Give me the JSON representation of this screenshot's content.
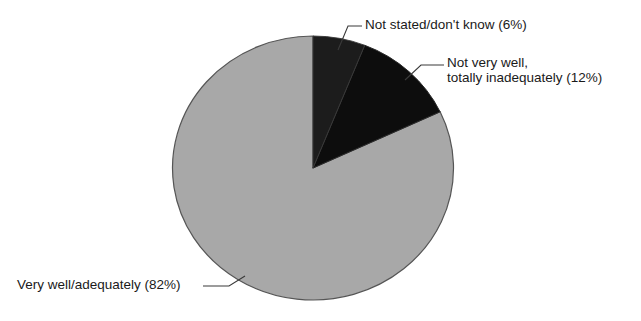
{
  "chart_data": {
    "type": "pie",
    "title": "",
    "subtitle": "",
    "xlabel": "",
    "ylabel": "",
    "grid": false,
    "legend_position": "callout-labels",
    "start_angle_deg": 0,
    "direction": "clockwise",
    "categories": [
      "Not stated/don't know",
      "Not very well, totally inadequately",
      "Very well/adequately"
    ],
    "values": [
      6,
      12,
      82
    ],
    "units": "%",
    "slices": [
      {
        "name": "Not stated/don't know",
        "value": 6,
        "label": "Not stated/don't know (6%)",
        "label_lines": [
          "Not stated/don't know (6%)"
        ],
        "color": "#1c1c1c",
        "start_deg": 0,
        "end_deg": 21.6
      },
      {
        "name": "Not very well, totally inadequately",
        "value": 12,
        "label": "Not very well, totally inadequately (12%)",
        "label_lines": [
          "Not very well,",
          "totally inadequately (12%)"
        ],
        "color": "#0d0d0d",
        "start_deg": 21.6,
        "end_deg": 64.8
      },
      {
        "name": "Very well/adequately",
        "value": 82,
        "label": "Very well/adequately (82%)",
        "label_lines": [
          "Very well/adequately (82%)"
        ],
        "color": "#a8a8a8",
        "start_deg": 64.8,
        "end_deg": 360
      }
    ]
  },
  "labels": {
    "not_stated": "Not stated/don't know (6%)",
    "not_very_well_line1": "Not very well,",
    "not_very_well_line2": "totally inadequately (12%)",
    "very_well": "Very well/adequately (82%)"
  },
  "colors": {
    "background": "#ffffff",
    "slice_gray": "#a8a8a8",
    "slice_dark": "#0d0d0d",
    "slice_dark_alt": "#1c1c1c",
    "outline": "#555555",
    "leader_line": "#3a3a3a",
    "text": "#1a1a1a"
  }
}
